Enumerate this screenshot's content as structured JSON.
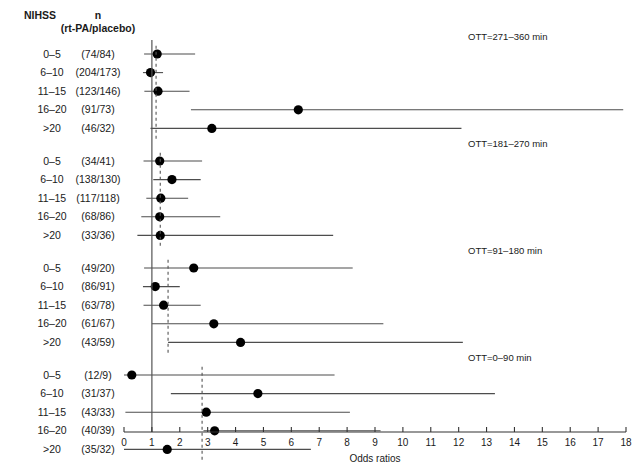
{
  "header": {
    "col_nihss": "NIHSS",
    "col_n_line1": "n",
    "col_n_line2": "(rt-PA/placebo)"
  },
  "axis": {
    "title": "Odds ratios",
    "ticks": [
      "0",
      "1",
      "2",
      "3",
      "4",
      "5",
      "6",
      "7",
      "8",
      "9",
      "10",
      "11",
      "12",
      "13",
      "14",
      "15",
      "16",
      "17",
      "18"
    ],
    "min": 0,
    "max": 18,
    "reference_line": 1
  },
  "chart_data": {
    "type": "scatter",
    "title": "",
    "xlabel": "Odds ratios",
    "ylabel": "",
    "xlim": [
      0,
      18
    ],
    "grid": false,
    "legend": "none",
    "reference_line_x": 1,
    "groups": [
      {
        "label": "OTT=271–360 min",
        "pooled_or": 1.15,
        "rows": [
          {
            "nihss": "0–5",
            "n": "(74/84)",
            "or": 1.19,
            "lo": 0.72,
            "hi": 2.55
          },
          {
            "nihss": "6–10",
            "n": "(204/173)",
            "or": 0.95,
            "lo": 0.68,
            "hi": 1.4
          },
          {
            "nihss": "11–15",
            "n": "(123/146)",
            "or": 1.22,
            "lo": 0.73,
            "hi": 2.35
          },
          {
            "nihss": "16–20",
            "n": "(91/73)",
            "or": 6.25,
            "lo": 2.4,
            "hi": 17.9
          },
          {
            "nihss": ">20",
            "n": "(46/32)",
            "or": 3.15,
            "lo": 0.95,
            "hi": 12.1
          }
        ]
      },
      {
        "label": "OTT=181–270 min",
        "pooled_or": 1.3,
        "rows": [
          {
            "nihss": "0–5",
            "n": "(34/41)",
            "or": 1.28,
            "lo": 0.7,
            "hi": 2.8
          },
          {
            "nihss": "6–10",
            "n": "(138/130)",
            "or": 1.72,
            "lo": 1.05,
            "hi": 2.75
          },
          {
            "nihss": "11–15",
            "n": "(117/118)",
            "or": 1.32,
            "lo": 0.8,
            "hi": 2.3
          },
          {
            "nihss": "16–20",
            "n": "(68/86)",
            "or": 1.28,
            "lo": 0.62,
            "hi": 3.45
          },
          {
            "nihss": ">20",
            "n": "(33/36)",
            "or": 1.3,
            "lo": 0.48,
            "hi": 7.5
          }
        ]
      },
      {
        "label": "OTT=91–180 min",
        "pooled_or": 1.58,
        "rows": [
          {
            "nihss": "0–5",
            "n": "(49/20)",
            "or": 2.5,
            "lo": 0.72,
            "hi": 8.2
          },
          {
            "nihss": "6–10",
            "n": "(86/91)",
            "or": 1.12,
            "lo": 0.68,
            "hi": 2.0
          },
          {
            "nihss": "11–15",
            "n": "(63/78)",
            "or": 1.42,
            "lo": 0.7,
            "hi": 2.75
          },
          {
            "nihss": "16–20",
            "n": "(61/67)",
            "or": 3.22,
            "lo": 1.0,
            "hi": 9.3
          },
          {
            "nihss": ">20",
            "n": "(43/59)",
            "or": 4.18,
            "lo": 1.58,
            "hi": 12.15
          }
        ]
      },
      {
        "label": "OTT=0–90 min",
        "pooled_or": 2.8,
        "rows": [
          {
            "nihss": "0–5",
            "n": "(12/9)",
            "or": 0.28,
            "lo": 0.0,
            "hi": 7.55
          },
          {
            "nihss": "6–10",
            "n": "(31/37)",
            "or": 4.8,
            "lo": 1.68,
            "hi": 13.3
          },
          {
            "nihss": "11–15",
            "n": "(43/33)",
            "or": 2.95,
            "lo": 0.05,
            "hi": 8.1
          },
          {
            "nihss": "16–20",
            "n": "(40/39)",
            "or": 3.25,
            "lo": 2.85,
            "hi": 9.2
          },
          {
            "nihss": ">20",
            "n": "(35/32)",
            "or": 1.55,
            "lo": 0.0,
            "hi": 6.7
          }
        ]
      }
    ]
  },
  "colors": {
    "marker": "#000000",
    "ci_line": "#4d4d4d",
    "reference": "#555555",
    "dashed": "#555555",
    "text": "#1a1a1a"
  }
}
